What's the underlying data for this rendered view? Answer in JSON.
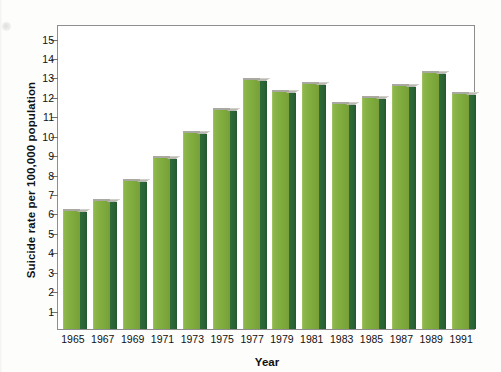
{
  "figure": {
    "background_color": "#fdfdfc",
    "plot_border_color": "#8d8d8d",
    "bar_front_color": "#82ad40",
    "bar_side_color": "#2b6636",
    "bar_top_color": "#b9b9b2"
  },
  "chart_data": {
    "type": "bar",
    "title": "",
    "xlabel": "Year",
    "ylabel": "Suicide rate per 100,000 population",
    "categories": [
      "1965",
      "1967",
      "1969",
      "1971",
      "1973",
      "1975",
      "1977",
      "1979",
      "1981",
      "1983",
      "1985",
      "1987",
      "1989",
      "1991"
    ],
    "values": [
      6.2,
      6.7,
      7.7,
      8.9,
      10.2,
      11.4,
      12.9,
      12.3,
      12.7,
      11.7,
      12.0,
      12.6,
      13.3,
      12.2
    ],
    "ylim": [
      0,
      15.7
    ],
    "yticks": [
      1,
      2,
      3,
      4,
      5,
      6,
      7,
      8,
      9,
      10,
      11,
      12,
      13,
      14,
      15
    ],
    "ytick_labels": [
      "1",
      "2",
      "3",
      "4",
      "5",
      "6",
      "7",
      "8",
      "9",
      "10",
      "11",
      "12",
      "13",
      "14",
      "15"
    ],
    "xtick_labels": [
      "1965",
      "1967",
      "1969",
      "1971",
      "1973",
      "1975",
      "1977",
      "1979",
      "1981",
      "1983",
      "1985",
      "1987",
      "1989",
      "1991"
    ],
    "grid": false,
    "legend": null,
    "legend_position": "none",
    "series": [
      {
        "name": "Suicide rate",
        "values": [
          6.2,
          6.7,
          7.7,
          8.9,
          10.2,
          11.4,
          12.9,
          12.3,
          12.7,
          11.7,
          12.0,
          12.6,
          13.3,
          12.2
        ]
      }
    ]
  }
}
